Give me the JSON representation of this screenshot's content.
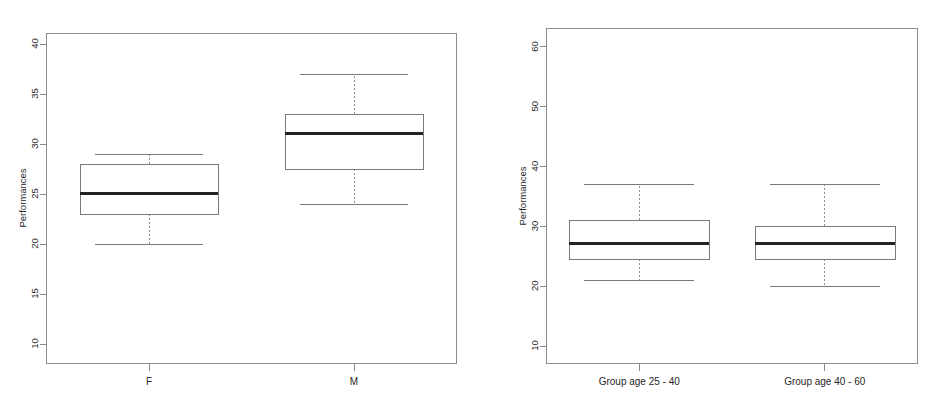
{
  "figure": {
    "background_color": "#ffffff",
    "panel_count": 2
  },
  "chart_data": [
    {
      "type": "box",
      "title": "",
      "xlabel": "",
      "ylabel": "Performances",
      "categories": [
        "F",
        "M"
      ],
      "ylim": [
        8,
        41
      ],
      "yticks": [
        10,
        15,
        20,
        25,
        30,
        35,
        40
      ],
      "ytick_labels": [
        "10",
        "15",
        "20",
        "25",
        "30",
        "35",
        "40"
      ],
      "grid": false,
      "legend": "none",
      "boxes": [
        {
          "category": "F",
          "whisker_low": 20,
          "q1": 23,
          "median": 25,
          "q3": 28,
          "whisker_high": 29
        },
        {
          "category": "M",
          "whisker_low": 24,
          "q1": 27.5,
          "median": 31,
          "q3": 33,
          "whisker_high": 37
        }
      ]
    },
    {
      "type": "box",
      "title": "",
      "xlabel": "",
      "ylabel": "Performances",
      "categories": [
        "Group age 25 - 40",
        "Group age 40 - 60"
      ],
      "ylim": [
        7,
        63
      ],
      "yticks": [
        10,
        20,
        30,
        40,
        50,
        60
      ],
      "ytick_labels": [
        "10",
        "20",
        "30",
        "40",
        "50",
        "60"
      ],
      "grid": false,
      "legend": "none",
      "boxes": [
        {
          "category": "Group age 25 - 40",
          "whisker_low": 21,
          "q1": 24.5,
          "median": 27,
          "q3": 31,
          "whisker_high": 37
        },
        {
          "category": "Group age 40 - 60",
          "whisker_low": 20,
          "q1": 24.5,
          "median": 27,
          "q3": 30,
          "whisker_high": 37
        }
      ]
    }
  ]
}
